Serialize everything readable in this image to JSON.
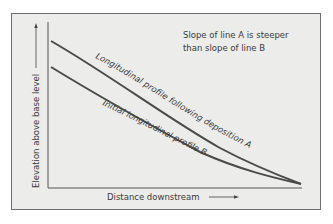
{
  "diagram": {
    "annotation": {
      "line1": "Slope of line A is steeper",
      "line2": "than slope of line B"
    },
    "y_axis_label": "Elevation above base level",
    "x_axis_label": "Distance downstream",
    "curves": [
      {
        "id": "A",
        "label": "Longitudinal profile following deposition A"
      },
      {
        "id": "B",
        "label": "Initial longitudinal profile B"
      }
    ],
    "colors": {
      "background": "#ececea",
      "curve": "#4a4a4a",
      "axis": "#555555",
      "text": "#3a3a3a"
    }
  }
}
